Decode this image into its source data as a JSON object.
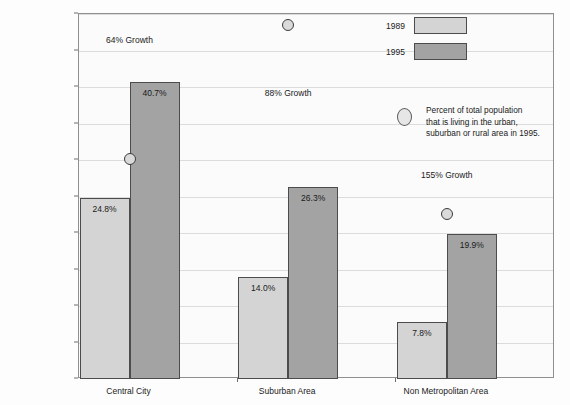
{
  "chart_data": {
    "type": "bar",
    "title": "",
    "xlabel": "",
    "ylabel": "",
    "ylim": [
      0,
      50
    ],
    "ytick_labels": [
      "0%",
      "5%",
      "10%",
      "15%",
      "20%",
      "25%",
      "30%",
      "35%",
      "40%",
      "45%",
      "50%"
    ],
    "ytick_values": [
      0,
      5,
      10,
      15,
      20,
      25,
      30,
      35,
      40,
      45,
      50
    ],
    "grid": true,
    "legend_position": "top-right",
    "categories": [
      "Central City",
      "Suburban Area",
      "Non Metropolitan Area"
    ],
    "series": [
      {
        "name": "1989",
        "color": "#d4d4d4",
        "values": [
          24.8,
          14.0,
          7.8
        ],
        "labels": [
          "24.8%",
          "14.0%",
          "7.8%"
        ]
      },
      {
        "name": "1995",
        "color": "#a3a3a3",
        "values": [
          40.7,
          26.3,
          19.9
        ],
        "labels": [
          "40.7%",
          "26.3%",
          "19.9%"
        ]
      }
    ],
    "markers": {
      "name": "Percent of total population 1995",
      "values": [
        30.1,
        48.5,
        22.6
      ]
    },
    "annotations": [
      {
        "text": "64% Growth",
        "category": "Central City",
        "value": 46.5
      },
      {
        "text": "88% Growth",
        "category": "Suburban Area",
        "value": 39.2
      },
      {
        "text": "155% Growth",
        "category": "Non Metropolitan Area",
        "value": 28.0
      }
    ]
  },
  "legend": {
    "key_1989": "1989",
    "key_1995": "1995",
    "marker_desc_line1": "Percent of total population",
    "marker_desc_line2": "that is living in the urban,",
    "marker_desc_line3": "suburban or rural area in 1995."
  }
}
